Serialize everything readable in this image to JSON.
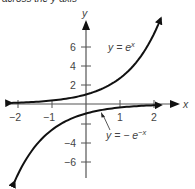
{
  "caption": "across the y-axis",
  "chart_data": {
    "type": "line",
    "title": "",
    "xlabel": "x",
    "ylabel": "y",
    "xlim": [
      -2.2,
      2.8
    ],
    "ylim": [
      -7.8,
      8.5
    ],
    "xticks": [
      -2,
      -1,
      1,
      2
    ],
    "yticks": [
      6,
      4,
      2,
      -4,
      -6
    ],
    "grid": false,
    "series": [
      {
        "name": "y = e^x",
        "label": "y = e",
        "label_sup": "x",
        "x": [
          -2.2,
          -2,
          -1.5,
          -1,
          -0.5,
          0,
          0.5,
          1,
          1.5,
          2,
          2.2
        ],
        "y": [
          0.11,
          0.14,
          0.22,
          0.37,
          0.61,
          1.0,
          1.65,
          2.72,
          4.48,
          7.39,
          8.1
        ]
      },
      {
        "name": "y = -e^(-x)",
        "label": "y = − e",
        "label_sup": "−x",
        "x": [
          -2.1,
          -2,
          -1.5,
          -1,
          -0.5,
          0,
          0.5,
          1,
          1.5,
          2,
          2.2
        ],
        "y": [
          -8.1,
          -7.39,
          -4.48,
          -2.72,
          -1.65,
          -1.0,
          -0.61,
          -0.37,
          -0.22,
          -0.14,
          -0.11
        ]
      }
    ],
    "annotations": [
      {
        "text": "y = e^x",
        "position": "upper right of y-axis near y=6"
      },
      {
        "text": "y = -e^(-x)",
        "position": "below x-axis, with pointer arrow to lower curve near x=0.5"
      }
    ]
  },
  "axis": {
    "x_label": "x",
    "y_label": "y",
    "x_tick_labels": [
      "−2",
      "−1",
      "1",
      "2"
    ],
    "y_tick_labels": [
      "6",
      "4",
      "2",
      "−4",
      "−6"
    ]
  },
  "labels": {
    "upper_curve_base": "y = e",
    "upper_curve_sup": "x",
    "lower_curve_base": "y = − e",
    "lower_curve_sup": "−x"
  }
}
